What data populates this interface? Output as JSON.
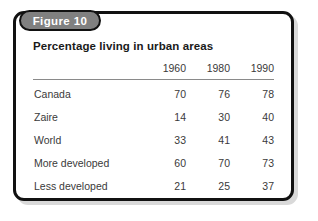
{
  "figure": {
    "tab_label": "Figure 10",
    "title": "Percentage living in urban areas",
    "colors": {
      "tab_background": "#808080",
      "tab_text": "#ffffff",
      "border": "#111111",
      "shadow": "#d9d9d9",
      "card_background": "#ffffff",
      "body_text": "#3a3a3a",
      "title_text": "#1a1a1a",
      "rule": "#8a8a8a"
    }
  },
  "chart_data": {
    "type": "table",
    "title": "Percentage living in urban areas",
    "xlabel": "",
    "ylabel": "",
    "row_header_label": "",
    "categories": [
      "Canada",
      "Zaire",
      "World",
      "More developed",
      "Less developed"
    ],
    "columns": [
      "1960",
      "1980",
      "1990"
    ],
    "series": [
      {
        "name": "1960",
        "values": [
          70,
          14,
          33,
          60,
          21
        ]
      },
      {
        "name": "1980",
        "values": [
          76,
          30,
          41,
          70,
          25
        ]
      },
      {
        "name": "1990",
        "values": [
          78,
          40,
          43,
          73,
          37
        ]
      }
    ],
    "rows": [
      {
        "label": "Canada",
        "values": [
          "70",
          "76",
          "78"
        ]
      },
      {
        "label": "Zaire",
        "values": [
          "14",
          "30",
          "40"
        ]
      },
      {
        "label": "World",
        "values": [
          "33",
          "41",
          "43"
        ]
      },
      {
        "label": "More developed",
        "values": [
          "60",
          "70",
          "73"
        ]
      },
      {
        "label": "Less developed",
        "values": [
          "21",
          "25",
          "37"
        ]
      }
    ]
  }
}
